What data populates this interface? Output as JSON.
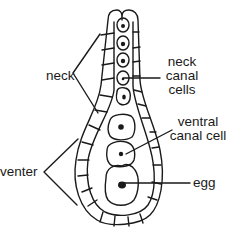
{
  "figure": {
    "labels": {
      "neck": "neck",
      "neck_canal_cells_line1": "neck",
      "neck_canal_cells_line2": "canal",
      "neck_canal_cells_line3": "cells",
      "ventral_canal_cell_line1": "ventral",
      "ventral_canal_cell_line2": "canal cell",
      "venter": "venter",
      "egg": "egg"
    },
    "colors": {
      "stroke": "#1a1a1a",
      "background": "#ffffff"
    }
  }
}
